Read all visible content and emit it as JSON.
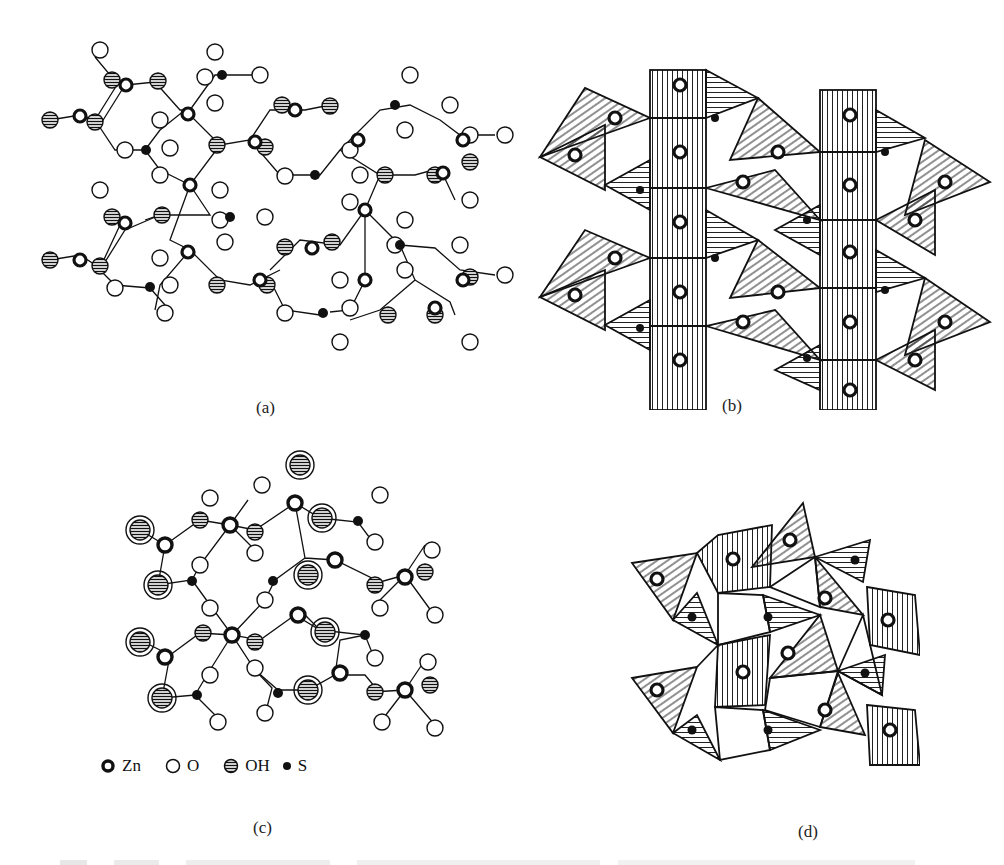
{
  "panels": [
    {
      "id": "a",
      "label": "(a)",
      "type": "ball-and-stick structure"
    },
    {
      "id": "b",
      "label": "(b)",
      "type": "polyhedral structure"
    },
    {
      "id": "c",
      "label": "(c)",
      "type": "ball-and-stick structure"
    },
    {
      "id": "d",
      "label": "(d)",
      "type": "polyhedral structure"
    }
  ],
  "legend": {
    "items": [
      {
        "symbol": "thick-ring",
        "label": "Zn"
      },
      {
        "symbol": "open-circle",
        "label": "O"
      },
      {
        "symbol": "hatched-circle",
        "label": "OH"
      },
      {
        "symbol": "filled-dot",
        "label": "S"
      }
    ]
  },
  "colors": {
    "ink": "#111111",
    "paper": "#ffffff"
  }
}
